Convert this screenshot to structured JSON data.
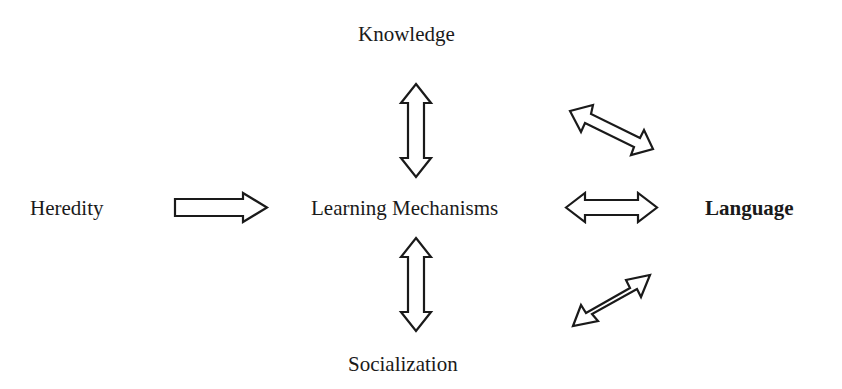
{
  "diagram": {
    "nodes": {
      "knowledge": "Knowledge",
      "heredity": "Heredity",
      "learning_mechanisms": "Learning Mechanisms",
      "language": "Language",
      "socialization": "Socialization"
    },
    "edges": [
      {
        "from": "Heredity",
        "to": "Learning Mechanisms",
        "type": "one-way"
      },
      {
        "from": "Learning Mechanisms",
        "to": "Knowledge",
        "type": "two-way"
      },
      {
        "from": "Learning Mechanisms",
        "to": "Socialization",
        "type": "two-way"
      },
      {
        "from": "Learning Mechanisms",
        "to": "Language",
        "type": "two-way"
      },
      {
        "from": "Knowledge",
        "to": "Language",
        "type": "two-way"
      },
      {
        "from": "Socialization",
        "to": "Language",
        "type": "two-way"
      }
    ],
    "colors": {
      "stroke": "#1a1a1a",
      "background": "#ffffff"
    }
  }
}
